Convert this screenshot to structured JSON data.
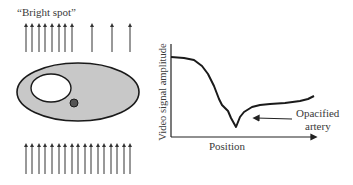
{
  "left_panel": {
    "caption": "“Bright spot”",
    "top_arrows_x": [
      26,
      32,
      39,
      45,
      52,
      59,
      65,
      72,
      92,
      112,
      130
    ],
    "bottom_arrows_x": [
      26,
      32,
      39,
      45,
      52,
      59,
      65,
      72,
      78,
      85,
      91,
      98,
      104,
      111,
      117,
      124,
      130
    ],
    "colors": {
      "body_fill": "#c8c8c8",
      "outline": "#1a1a1a",
      "cavity_fill": "#ffffff",
      "artery_fill": "#555555"
    }
  },
  "graph": {
    "y_label": "Video signal amplitude",
    "x_label": "Position",
    "annotation_line1": "Opacified",
    "annotation_line2": "artery"
  }
}
